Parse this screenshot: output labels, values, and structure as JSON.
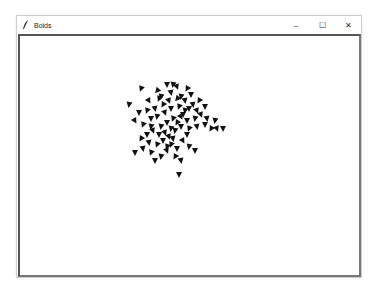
{
  "window": {
    "title": "Boids",
    "app_icon": "feather-icon",
    "controls": {
      "minimize": "–",
      "maximize": "☐",
      "close": "✕"
    }
  },
  "canvas": {
    "background": "#ffffff",
    "boid_color": "#111111",
    "boids": [
      [
        140,
        88,
        20
      ],
      [
        148,
        100,
        -30
      ],
      [
        156,
        90,
        40
      ],
      [
        160,
        96,
        10
      ],
      [
        166,
        84,
        0
      ],
      [
        172,
        84,
        10
      ],
      [
        176,
        86,
        -20
      ],
      [
        186,
        88,
        30
      ],
      [
        190,
        94,
        0
      ],
      [
        184,
        100,
        -10
      ],
      [
        176,
        98,
        40
      ],
      [
        168,
        100,
        -20
      ],
      [
        162,
        104,
        30
      ],
      [
        154,
        108,
        -10
      ],
      [
        146,
        110,
        20
      ],
      [
        138,
        112,
        0
      ],
      [
        128,
        104,
        10
      ],
      [
        134,
        120,
        -30
      ],
      [
        142,
        124,
        20
      ],
      [
        150,
        118,
        0
      ],
      [
        156,
        116,
        10
      ],
      [
        164,
        112,
        -20
      ],
      [
        170,
        108,
        0
      ],
      [
        178,
        106,
        20
      ],
      [
        184,
        110,
        10
      ],
      [
        192,
        104,
        -10
      ],
      [
        198,
        100,
        30
      ],
      [
        204,
        106,
        0
      ],
      [
        200,
        114,
        -20
      ],
      [
        194,
        118,
        10
      ],
      [
        186,
        120,
        0
      ],
      [
        180,
        116,
        -30
      ],
      [
        172,
        118,
        20
      ],
      [
        166,
        122,
        0
      ],
      [
        160,
        126,
        10
      ],
      [
        152,
        130,
        -20
      ],
      [
        146,
        134,
        0
      ],
      [
        140,
        138,
        30
      ],
      [
        148,
        142,
        -10
      ],
      [
        156,
        144,
        20
      ],
      [
        162,
        140,
        0
      ],
      [
        168,
        136,
        -20
      ],
      [
        174,
        130,
        10
      ],
      [
        180,
        126,
        0
      ],
      [
        188,
        128,
        20
      ],
      [
        196,
        126,
        -10
      ],
      [
        204,
        124,
        0
      ],
      [
        210,
        128,
        30
      ],
      [
        216,
        128,
        -20
      ],
      [
        222,
        128,
        0
      ],
      [
        214,
        120,
        10
      ],
      [
        206,
        118,
        -10
      ],
      [
        170,
        144,
        20
      ],
      [
        176,
        148,
        0
      ],
      [
        182,
        140,
        -30
      ],
      [
        188,
        146,
        10
      ],
      [
        194,
        150,
        0
      ],
      [
        166,
        150,
        -20
      ],
      [
        160,
        156,
        10
      ],
      [
        154,
        160,
        0
      ],
      [
        150,
        152,
        20
      ],
      [
        142,
        148,
        -10
      ],
      [
        134,
        152,
        0
      ],
      [
        174,
        156,
        30
      ],
      [
        180,
        160,
        -10
      ],
      [
        178,
        174,
        0
      ],
      [
        170,
        128,
        10
      ],
      [
        164,
        132,
        -20
      ],
      [
        176,
        122,
        30
      ],
      [
        182,
        114,
        0
      ],
      [
        158,
        98,
        20
      ],
      [
        170,
        92,
        -10
      ],
      [
        180,
        96,
        10
      ],
      [
        188,
        108,
        0
      ],
      [
        196,
        110,
        -20
      ],
      [
        150,
        126,
        10
      ],
      [
        158,
        134,
        0
      ],
      [
        166,
        146,
        20
      ],
      [
        172,
        138,
        -10
      ],
      [
        186,
        134,
        0
      ]
    ]
  }
}
